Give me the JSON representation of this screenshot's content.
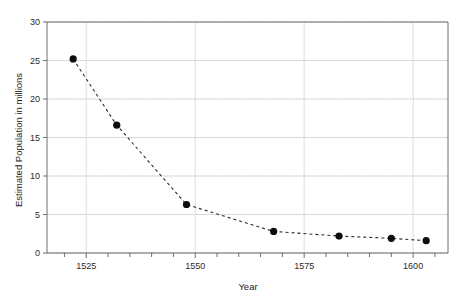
{
  "chart_data": {
    "type": "line",
    "title": "",
    "xlabel": "Year",
    "ylabel": "Estimated Population in millions",
    "xlim": [
      1516,
      1608
    ],
    "ylim": [
      0,
      30
    ],
    "grid": true,
    "legend": "none",
    "line_style": "dashed",
    "marker": "filled-circle",
    "marker_color": "#0d0d0d",
    "line_color": "#2a2a2a",
    "x_ticks": [
      1525,
      1550,
      1575,
      1600
    ],
    "x_tick_labels": [
      "1525",
      "1550",
      "1575",
      "1600"
    ],
    "x_minor_step": 5,
    "y_ticks": [
      0,
      5,
      10,
      15,
      20,
      25,
      30
    ],
    "y_tick_labels": [
      "0",
      "5",
      "10",
      "15",
      "20",
      "25",
      "30"
    ],
    "x": [
      1522,
      1532,
      1548,
      1568,
      1583,
      1595,
      1603
    ],
    "values": [
      25.2,
      16.6,
      6.3,
      2.8,
      2.2,
      1.9,
      1.6
    ],
    "points": [
      {
        "year": 1522,
        "population": 25.2
      },
      {
        "year": 1532,
        "population": 16.6
      },
      {
        "year": 1548,
        "population": 6.3
      },
      {
        "year": 1568,
        "population": 2.8
      },
      {
        "year": 1583,
        "population": 2.2
      },
      {
        "year": 1595,
        "population": 1.9
      },
      {
        "year": 1603,
        "population": 1.6
      }
    ]
  }
}
